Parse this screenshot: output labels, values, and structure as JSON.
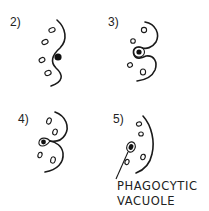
{
  "diagram": {
    "type": "phagocytosis-stages",
    "colors": {
      "ink": "#1a1a1a",
      "background": "#ffffff"
    },
    "panels": [
      {
        "label": "2)",
        "stage": 2
      },
      {
        "label": "3)",
        "stage": 3
      },
      {
        "label": "4)",
        "stage": 4
      },
      {
        "label": "5)",
        "stage": 5
      }
    ],
    "caption": {
      "line1": "PHAGOCYTIC",
      "line2": "VACUOLE"
    }
  }
}
